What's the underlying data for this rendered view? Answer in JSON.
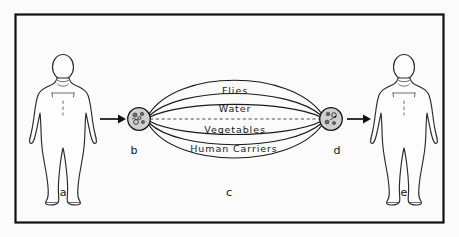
{
  "figure": {
    "background_color": "#fbfbfb",
    "ink_color": "#1a1a1a",
    "frame": {
      "x": 15,
      "y": 14,
      "width": 428,
      "height": 208
    }
  },
  "transmission_routes": {
    "count": 4,
    "items": [
      {
        "key": "flies",
        "label": "Flies"
      },
      {
        "key": "water",
        "label": "Water"
      },
      {
        "key": "vegetables",
        "label": "Vegetables"
      },
      {
        "key": "human_carriers",
        "label": "Human Carriers"
      }
    ]
  },
  "key_labels": [
    {
      "key": "a",
      "label": "a",
      "x": 63,
      "y": 193,
      "describes": "source-person-figure"
    },
    {
      "key": "b",
      "label": "b",
      "x": 134,
      "y": 151,
      "describes": "source-pathogen-node"
    },
    {
      "key": "c",
      "label": "c",
      "x": 229,
      "y": 193,
      "describes": "transmission-routes-region"
    },
    {
      "key": "d",
      "label": "d",
      "x": 337,
      "y": 151,
      "describes": "destination-pathogen-node"
    },
    {
      "key": "e",
      "label": "e",
      "x": 404,
      "y": 193,
      "describes": "recipient-person-figure"
    }
  ],
  "nodes": {
    "source_pathogen": {
      "id": "b",
      "cx": 139,
      "cy": 119,
      "r": 11.5,
      "fill": "#cfcfcf"
    },
    "destination_pathogen": {
      "id": "d",
      "cx": 331,
      "cy": 119,
      "r": 11.5,
      "fill": "#cfcfcf"
    }
  },
  "figures": {
    "source_person": {
      "id": "a",
      "center_x": 63,
      "label": "a"
    },
    "recipient_person": {
      "id": "e",
      "center_x": 404,
      "label": "e"
    }
  },
  "arrows": [
    {
      "key": "person-to-source-node",
      "from": "a",
      "to": "b",
      "x1": 100,
      "x2": 124,
      "y": 119
    },
    {
      "key": "dest-node-to-person",
      "from": "d",
      "to": "e",
      "x1": 347,
      "x2": 371,
      "y": 119
    }
  ],
  "center_axis": {
    "dashed": true,
    "x1": 150,
    "x2": 320,
    "y": 119
  }
}
